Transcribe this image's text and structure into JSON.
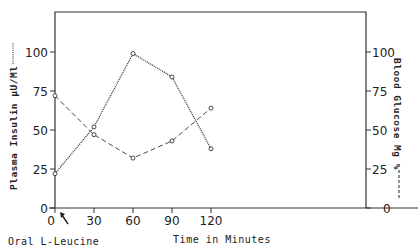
{
  "chart_data": {
    "type": "line",
    "title": "",
    "xlabel": "Time in Minutes",
    "x_annotation": "Oral L-Leucine",
    "ylabel_left": "Plasma Insulin µU/Ml",
    "ylabel_right": "Blood Glucose Mg %",
    "x": [
      0,
      30,
      60,
      90,
      120
    ],
    "x_ticks": [
      "0",
      "30",
      "60",
      "90",
      "120"
    ],
    "y_ticks_left": [
      "0",
      "25",
      "50",
      "75",
      "100"
    ],
    "y_ticks_right": [
      "0",
      "25",
      "50",
      "75",
      "100"
    ],
    "ylim_left": [
      0,
      125
    ],
    "ylim_right": [
      0,
      125
    ],
    "grid": false,
    "legend": "axis labels indicate line style (left: dotted, right: dashed)",
    "series": [
      {
        "name": "Plasma Insulin µU/Ml",
        "axis": "left",
        "style": "dotted",
        "values": [
          22,
          52,
          99,
          84,
          38
        ]
      },
      {
        "name": "Blood Glucose Mg %",
        "axis": "right",
        "style": "dashed",
        "values": [
          72,
          47,
          32,
          43,
          64
        ]
      }
    ]
  },
  "labels": {
    "xlabel": "Time in Minutes",
    "annotation": "Oral L-Leucine",
    "ylabel_left": "Plasma Insulin µU/Ml",
    "ylabel_right": "Blood Glucose Mg %"
  }
}
